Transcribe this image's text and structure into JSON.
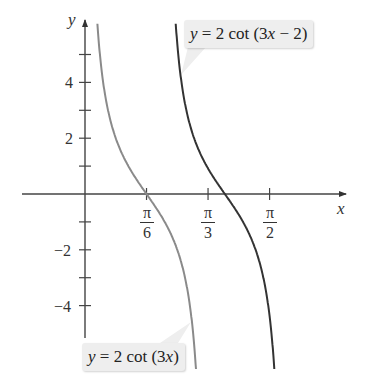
{
  "chart_data": {
    "type": "line",
    "title": "",
    "xlabel": "x",
    "ylabel": "y",
    "x_ticks": [
      {
        "num": "π",
        "den": "6",
        "value": 0.5236
      },
      {
        "num": "π",
        "den": "3",
        "value": 1.0472
      },
      {
        "num": "π",
        "den": "2",
        "value": 1.5708
      }
    ],
    "y_ticks_labeled": [
      "4",
      "2",
      "−2",
      "−4"
    ],
    "y_tick_values_labeled": [
      4,
      2,
      -2,
      -4
    ],
    "y_minor_ticks": [
      5,
      3,
      1,
      -1,
      -3
    ],
    "xlim": [
      -0.54,
      2.2
    ],
    "ylim": [
      -5.2,
      6.2
    ],
    "grid": false,
    "series": [
      {
        "name": "y = 2 cot (3x)",
        "function": "2*cot(3*x)",
        "color": "#8a8a8a",
        "asymptotes": [
          0,
          1.0472
        ],
        "zero": 0.5236
      },
      {
        "name": "y = 2 cot (3x − 2)",
        "function": "2*cot(3*x-2)",
        "color": "#333333",
        "asymptotes": [
          0.6667,
          1.7139
        ],
        "zero": 1.1903
      }
    ],
    "annotations": [
      {
        "text": "y = 2 cot (3x − 2)",
        "target_series": 1
      },
      {
        "text": "y = 2 cot (3x)",
        "target_series": 0
      }
    ]
  },
  "labels": {
    "x_axis": "x",
    "y_axis": "y",
    "y4": "4",
    "y2": "2",
    "yn2": "−2",
    "yn4": "−4",
    "pi": "π",
    "d6": "6",
    "d3": "3",
    "d2": "2",
    "top_label": {
      "y": "y",
      "eq": " = 2 cot (3",
      "x": "x",
      "rest": " − 2)"
    },
    "bottom_label": {
      "y": "y",
      "eq": " = 2 cot (3",
      "x": "x",
      "rest": ")"
    }
  }
}
